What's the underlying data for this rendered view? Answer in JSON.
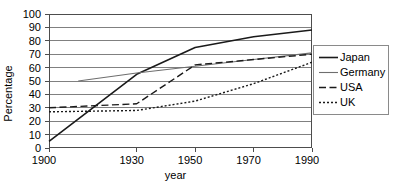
{
  "chart_data": {
    "type": "line",
    "title": "",
    "xlabel": "year",
    "ylabel": "Percentage",
    "categories": [
      "1900",
      "1910",
      "1920",
      "1930",
      "1940",
      "1950",
      "1960",
      "1970",
      "1980",
      "1990"
    ],
    "tick_labels": [
      "1900",
      "1930",
      "1950",
      "1970",
      "1990"
    ],
    "tick_categories": [
      "1900",
      "1930",
      "1950",
      "1970",
      "1990"
    ],
    "ylim": [
      0,
      100
    ],
    "yticks": [
      0,
      10,
      20,
      30,
      40,
      50,
      60,
      70,
      80,
      90,
      100
    ],
    "grid": "horizontal",
    "legend_position": "right-outside",
    "series": [
      {
        "name": "Japan",
        "style": "solid",
        "color": "#1a1a1a",
        "x": [
          "1900",
          "1930",
          "1950",
          "1970",
          "1990"
        ],
        "values": [
          5,
          55,
          75,
          83,
          88
        ]
      },
      {
        "name": "Germany",
        "style": "solid-thin",
        "color": "#6e6e6e",
        "x": [
          "1910",
          "1930",
          "1950",
          "1970",
          "1990"
        ],
        "values": [
          50,
          56,
          61,
          66,
          71
        ]
      },
      {
        "name": "USA",
        "style": "dashed",
        "color": "#1a1a1a",
        "x": [
          "1900",
          "1930",
          "1950",
          "1970",
          "1990"
        ],
        "values": [
          30,
          33,
          62,
          66,
          70
        ]
      },
      {
        "name": "UK",
        "style": "dotted",
        "color": "#1a1a1a",
        "x": [
          "1900",
          "1930",
          "1950",
          "1970",
          "1990"
        ],
        "values": [
          27,
          28,
          35,
          48,
          64
        ]
      }
    ]
  },
  "legend": {
    "items": [
      {
        "label": "Japan"
      },
      {
        "label": "Germany"
      },
      {
        "label": "USA"
      },
      {
        "label": "UK"
      }
    ]
  },
  "colors": {
    "axis": "#4d4d4d",
    "grid": "#808080",
    "legend_border": "#8a8a8a",
    "text": "#000000"
  }
}
